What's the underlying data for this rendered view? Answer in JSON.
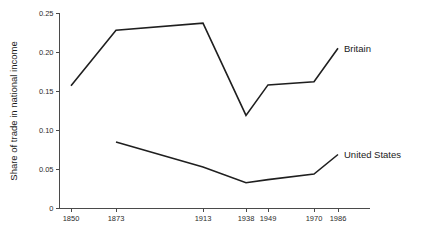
{
  "chart_data": {
    "type": "line",
    "title": "",
    "subtitle": "",
    "xlabel": "",
    "ylabel": "Share of trade in national income",
    "x": [
      1850,
      1873,
      1913,
      1938,
      1949,
      1970,
      1986
    ],
    "categories": [
      "1850",
      "1873",
      "1913",
      "1938",
      "1949",
      "1970",
      "1986"
    ],
    "xtick_labels": [
      "1850",
      "1873",
      "1913",
      "1938",
      "1949",
      "1970",
      "1986"
    ],
    "ytick_labels": [
      "0.25",
      "0.20",
      "0.15",
      "0.10",
      "0.05",
      "0"
    ],
    "ytick_values": [
      0.25,
      0.2,
      0.15,
      0.1,
      0.05,
      0
    ],
    "ylim": [
      0,
      0.25
    ],
    "xlim": [
      1850,
      1986
    ],
    "grid": false,
    "legend_position": "inline-right",
    "series": [
      {
        "name": "Britain",
        "label": "Britain",
        "x": [
          1850,
          1873,
          1913,
          1938,
          1949,
          1970,
          1986
        ],
        "values": [
          0.157,
          0.228,
          0.237,
          0.119,
          0.158,
          0.162,
          0.205
        ]
      },
      {
        "name": "United States",
        "label": "United States",
        "x": [
          1873,
          1913,
          1938,
          1949,
          1970,
          1986
        ],
        "values": [
          0.085,
          0.053,
          0.033,
          0.037,
          0.044,
          0.069
        ]
      }
    ],
    "annotations": [
      {
        "text": "Britain",
        "for_series": "Britain"
      },
      {
        "text": "United States",
        "for_series": "United States"
      }
    ],
    "colors": {
      "line": "#1f1f1f",
      "axis": "#4a4a4a",
      "text": "#1a1a1a",
      "background": "#ffffff"
    }
  }
}
